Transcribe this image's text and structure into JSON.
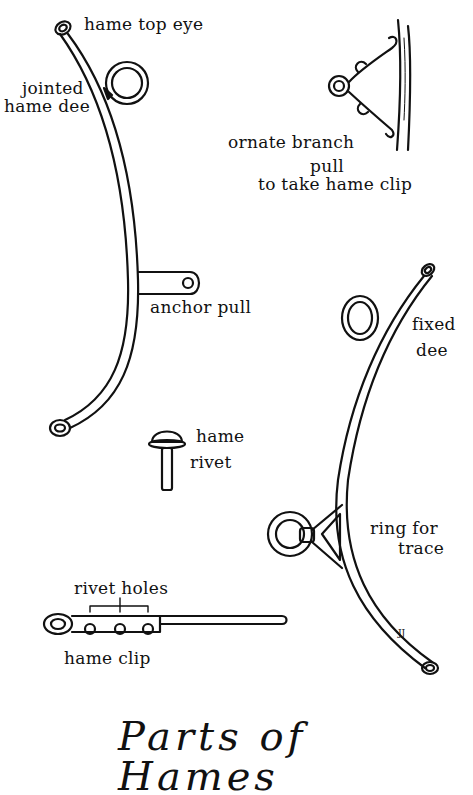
{
  "title": "Parts of Hames",
  "labels": {
    "hame_top_eye": "hame top eye",
    "jointed_hame_dee_1": "jointed",
    "jointed_hame_dee_2": "hame dee",
    "ornate_branch_pull_1": "ornate branch",
    "ornate_branch_pull_2": "pull",
    "ornate_branch_pull_3": "to take hame clip",
    "anchor_pull": "anchor pull",
    "fixed_dee_1": "fixed",
    "fixed_dee_2": "dee",
    "hame_rivet_1": "hame",
    "hame_rivet_2": "rivet",
    "ring_for_trace_1": "ring for",
    "ring_for_trace_2": "trace",
    "rivet_holes": "rivet holes",
    "hame_clip": "hame clip"
  },
  "signature": "JJ"
}
